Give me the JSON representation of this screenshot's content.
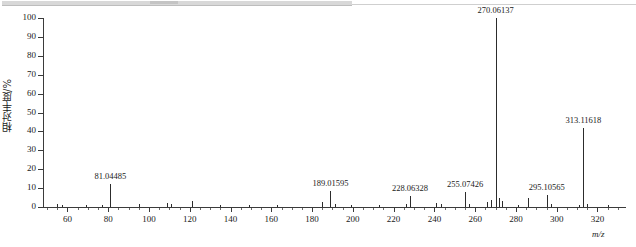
{
  "window": {
    "chrome_strip": "scrolled-toolbar-strip"
  },
  "chart_data": {
    "type": "bar",
    "title": "",
    "xlabel": "m/z",
    "ylabel": "相对丰度/%",
    "xlim": [
      48,
      334
    ],
    "ylim": [
      0,
      100
    ],
    "grid": false,
    "legend": null,
    "xticks": [
      60,
      80,
      100,
      120,
      140,
      160,
      180,
      200,
      220,
      240,
      260,
      280,
      300,
      320
    ],
    "xtick_labels": [
      "60",
      "80",
      "100",
      "120",
      "140",
      "160",
      "180",
      "200",
      "220",
      "240",
      "260",
      "280",
      "300",
      "320"
    ],
    "xminor_step": 5,
    "yticks": [
      0,
      10,
      20,
      30,
      40,
      50,
      60,
      70,
      80,
      90,
      100
    ],
    "ytick_labels": [
      "0",
      "10",
      "20",
      "30",
      "40",
      "50",
      "60",
      "70",
      "80",
      "90",
      "100"
    ],
    "labeled_peaks": [
      {
        "mz": 81.04485,
        "label": "81.04485",
        "intensity": 12.0
      },
      {
        "mz": 189.01595,
        "label": "189.01595",
        "intensity": 8.5
      },
      {
        "mz": 228.06328,
        "label": "228.06328",
        "intensity": 6.0
      },
      {
        "mz": 255.07426,
        "label": "255.07426",
        "intensity": 8.0
      },
      {
        "mz": 270.06137,
        "label": "270.06137",
        "intensity": 100.0
      },
      {
        "mz": 295.10565,
        "label": "295.10565",
        "intensity": 6.5
      },
      {
        "mz": 313.11618,
        "label": "313.11618",
        "intensity": 42.0
      }
    ],
    "minor_peaks": [
      {
        "mz": 55.0,
        "intensity": 1.6
      },
      {
        "mz": 57.5,
        "intensity": 1.0
      },
      {
        "mz": 69.0,
        "intensity": 1.2
      },
      {
        "mz": 77.0,
        "intensity": 1.0
      },
      {
        "mz": 95.0,
        "intensity": 1.4
      },
      {
        "mz": 109.0,
        "intensity": 2.2
      },
      {
        "mz": 111.0,
        "intensity": 1.6
      },
      {
        "mz": 121.0,
        "intensity": 3.4
      },
      {
        "mz": 135.0,
        "intensity": 1.0
      },
      {
        "mz": 149.0,
        "intensity": 1.2
      },
      {
        "mz": 163.0,
        "intensity": 1.0
      },
      {
        "mz": 185.0,
        "intensity": 2.8
      },
      {
        "mz": 191.0,
        "intensity": 1.4
      },
      {
        "mz": 199.0,
        "intensity": 1.0
      },
      {
        "mz": 213.0,
        "intensity": 1.2
      },
      {
        "mz": 226.0,
        "intensity": 1.4
      },
      {
        "mz": 241.0,
        "intensity": 2.0
      },
      {
        "mz": 243.0,
        "intensity": 1.4
      },
      {
        "mz": 257.0,
        "intensity": 1.6
      },
      {
        "mz": 266.0,
        "intensity": 2.4
      },
      {
        "mz": 268.0,
        "intensity": 3.6
      },
      {
        "mz": 271.5,
        "intensity": 5.0
      },
      {
        "mz": 273.0,
        "intensity": 3.0
      },
      {
        "mz": 281.0,
        "intensity": 1.2
      },
      {
        "mz": 286.0,
        "intensity": 4.6
      },
      {
        "mz": 297.0,
        "intensity": 1.4
      },
      {
        "mz": 311.0,
        "intensity": 1.2
      },
      {
        "mz": 315.0,
        "intensity": 1.6
      },
      {
        "mz": 325.0,
        "intensity": 1.0
      }
    ]
  }
}
